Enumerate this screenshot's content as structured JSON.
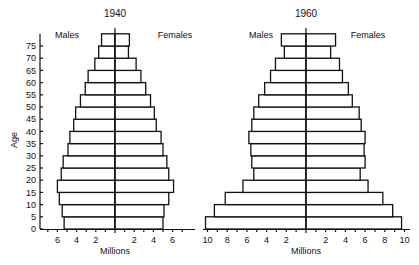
{
  "chart_data": [
    {
      "type": "bar",
      "subtype": "population-pyramid",
      "title": "1940",
      "left_label": "Males",
      "right_label": "Females",
      "xlabel": "Millions",
      "ylabel": "Age",
      "y_ticks": [
        "0",
        "5",
        "10",
        "15",
        "20",
        "25",
        "30",
        "35",
        "40",
        "45",
        "50",
        "55",
        "60",
        "65",
        "70",
        "75"
      ],
      "x_ticks_left": [
        "6",
        "4",
        "2"
      ],
      "x_ticks_right": [
        "2",
        "4",
        "6"
      ],
      "xlim": [
        0,
        7
      ],
      "categories": [
        "0-4",
        "5-9",
        "10-14",
        "15-19",
        "20-24",
        "25-29",
        "30-34",
        "35-39",
        "40-44",
        "45-49",
        "50-54",
        "55-59",
        "60-64",
        "65-69",
        "70-74",
        "75+"
      ],
      "series": [
        {
          "name": "Males",
          "values": [
            5.3,
            5.5,
            5.8,
            6.0,
            5.6,
            5.4,
            4.9,
            4.7,
            4.3,
            4.1,
            3.6,
            3.1,
            2.8,
            2.1,
            1.7,
            1.4
          ]
        },
        {
          "name": "Females",
          "values": [
            5.0,
            5.1,
            5.6,
            6.1,
            5.6,
            5.4,
            5.0,
            4.8,
            4.3,
            4.1,
            3.7,
            3.2,
            2.7,
            2.2,
            1.4,
            1.5
          ]
        }
      ],
      "grid": false
    },
    {
      "type": "bar",
      "subtype": "population-pyramid",
      "title": "1960",
      "left_label": "Males",
      "right_label": "Females",
      "xlabel": "Millions",
      "ylabel": "Age",
      "x_ticks_left": [
        "10",
        "8",
        "6",
        "4",
        "2"
      ],
      "x_ticks_right": [
        "2",
        "4",
        "6",
        "8",
        "10"
      ],
      "xlim": [
        0,
        10.5
      ],
      "categories": [
        "0-4",
        "5-9",
        "10-14",
        "15-19",
        "20-24",
        "25-29",
        "30-34",
        "35-39",
        "40-44",
        "45-49",
        "50-54",
        "55-59",
        "60-64",
        "65-69",
        "70-74",
        "75+"
      ],
      "series": [
        {
          "name": "Males",
          "values": [
            10.2,
            9.3,
            8.2,
            6.4,
            5.3,
            5.5,
            5.6,
            5.8,
            5.5,
            5.3,
            4.8,
            4.2,
            3.6,
            3.1,
            2.2,
            2.5
          ]
        },
        {
          "name": "Females",
          "values": [
            9.7,
            8.8,
            7.8,
            6.3,
            5.5,
            6.0,
            5.9,
            6.0,
            5.6,
            5.4,
            4.7,
            4.3,
            3.7,
            3.4,
            2.5,
            3.0
          ]
        }
      ],
      "grid": false
    }
  ]
}
